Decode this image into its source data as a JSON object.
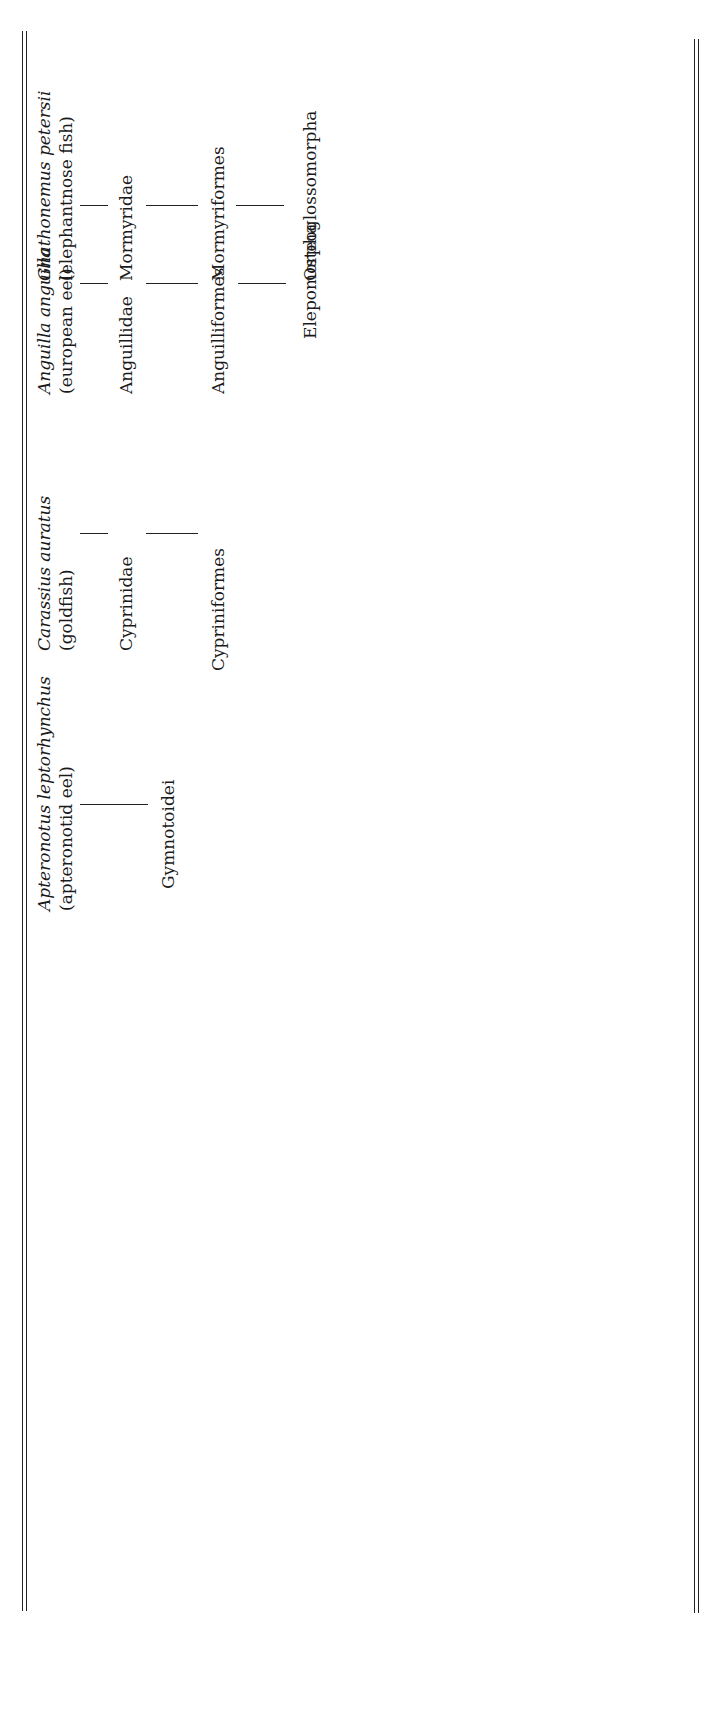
{
  "figure": {
    "orientation": "rotated-90-ccw",
    "species": [
      {
        "scientific": "Gnathonemus petersii",
        "common": "(elephantnose fish)",
        "family": "Mormyridae",
        "order": "Mormyriformes",
        "superorder": "Osteoglossomorpha"
      },
      {
        "scientific": "Anguilla anguilla",
        "common": "(european eel)",
        "family": "Anguillidae",
        "order": "Anguilliformes",
        "superorder": "Elepomorpha"
      },
      {
        "scientific": "Carassius auratus",
        "common": "(goldfish)",
        "family": "Cyprinidae",
        "order": "Cypriniformes",
        "superorder": ""
      },
      {
        "scientific": "Apteronotus leptorhynchus",
        "common": "(apteronotid eel)",
        "family": "",
        "order": "Gymnotoidei",
        "superorder": ""
      },
      {
        "scientific": "Clarias gariepinus",
        "common": "(african catfish)",
        "family": "",
        "order": "Siluroidei",
        "superorder": ""
      },
      {
        "scientific": "Gasterosteus aculeatus",
        "common": "(three spined stickleback)",
        "family": "Gasterosteidae",
        "order": "Gasterosteiformes",
        "superorder": "Acanthopterygii"
      }
    ],
    "clades": {
      "siluriformes": "Siluriformes",
      "ostaryophysi": "Ostaryophysi",
      "neoteleostei": "Neoteleostei",
      "euteleostei": "Euteleostei",
      "teleostei": "Teleostei"
    }
  }
}
